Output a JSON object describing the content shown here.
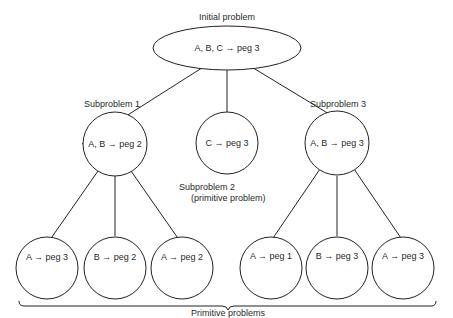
{
  "diagram": {
    "title": "Initial problem",
    "root": {
      "label": "A, B, C → peg 3"
    },
    "subproblems": [
      {
        "caption": "Subproblem 1",
        "label": "A, B → peg 2",
        "children": [
          {
            "label": "A → peg 3"
          },
          {
            "label": "B → peg 2"
          },
          {
            "label": "A → peg 2"
          }
        ]
      },
      {
        "caption": "Subproblem 2",
        "caption2": "(primitive problem)",
        "label": "C → peg 3"
      },
      {
        "caption": "Subproblem 3",
        "label": "A, B → peg 3",
        "children": [
          {
            "label": "A → peg 1"
          },
          {
            "label": "B → peg 3"
          },
          {
            "label": "A → peg 3"
          }
        ]
      }
    ],
    "brace_label": "Primitive problems",
    "colors": {
      "stroke": "#222222",
      "background": "#ffffff"
    }
  }
}
